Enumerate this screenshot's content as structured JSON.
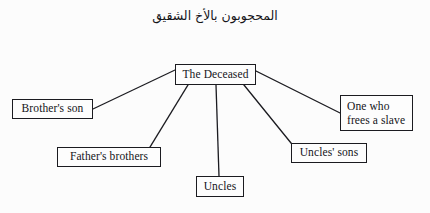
{
  "document": {
    "background_color": "#fcfcfc",
    "ink_color": "#141419"
  },
  "title": {
    "arabic": "المحجوبون بالأخ الشقيق"
  },
  "diagram": {
    "type": "hierarchy",
    "root": {
      "id": "deceased",
      "label": "The Deceased"
    },
    "nodes": [
      {
        "id": "brothers-son",
        "label": "Brother's son"
      },
      {
        "id": "fathers-brothers",
        "label": "Father's brothers"
      },
      {
        "id": "uncles",
        "label": "Uncles"
      },
      {
        "id": "uncles-sons",
        "label": "Uncles' sons"
      },
      {
        "id": "one-who-frees",
        "label": "One who\nfrees a slave"
      }
    ],
    "edges": [
      {
        "from": "deceased",
        "to": "brothers-son"
      },
      {
        "from": "deceased",
        "to": "fathers-brothers"
      },
      {
        "from": "deceased",
        "to": "uncles"
      },
      {
        "from": "deceased",
        "to": "uncles-sons"
      },
      {
        "from": "deceased",
        "to": "one-who-frees"
      }
    ],
    "edge_style": {
      "stroke": "#1b1b20",
      "stroke_width": 1.3
    }
  }
}
